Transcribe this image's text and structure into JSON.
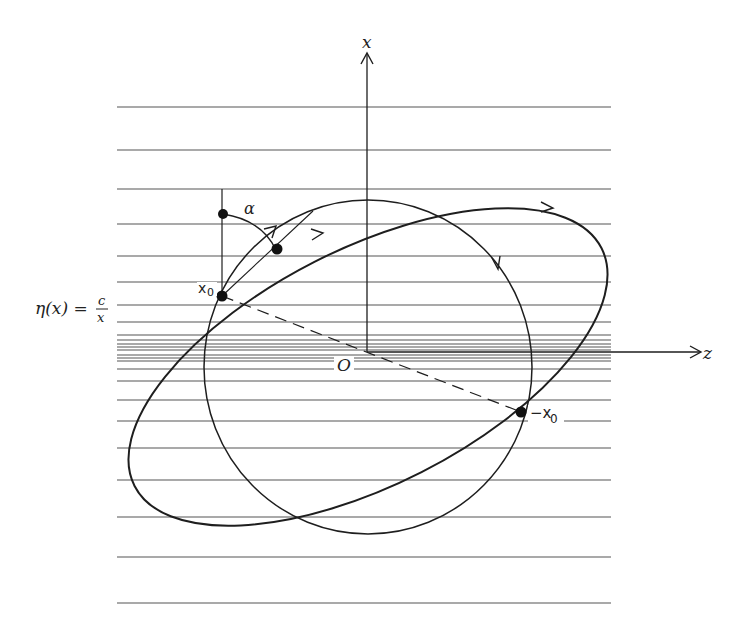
{
  "figure": {
    "axes": {
      "vertical_label": "x",
      "horizontal_label": "z",
      "origin_label": "O"
    },
    "refractive_index_label": "η(x) = c/x",
    "refractive_index_parts": {
      "lhs": "η(x) =",
      "numerator": "c",
      "denominator": "x"
    },
    "points": {
      "start": "x₀",
      "start_base": "x",
      "start_sub": "0",
      "antipode": "−x₀",
      "antipode_base": "−x",
      "antipode_sub": "0"
    },
    "angle_label": "α",
    "layers_upper_y": [
      107,
      150,
      189,
      224,
      256,
      282,
      305,
      322,
      335,
      340,
      344,
      347,
      350
    ],
    "layers_lower_y": [
      355,
      358,
      361,
      369,
      381,
      400,
      421,
      448,
      480,
      517,
      557,
      603
    ],
    "colors": {
      "ink": "#1e1e1e",
      "layer_line": "#555555",
      "background": "#ffffff"
    }
  }
}
